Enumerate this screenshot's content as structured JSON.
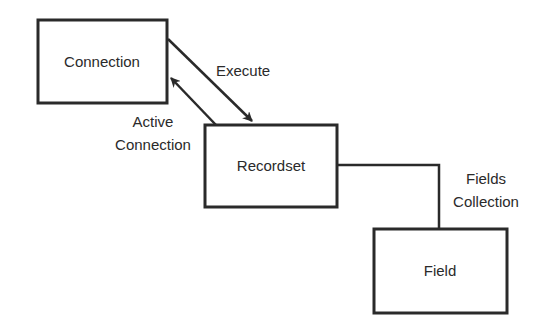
{
  "diagram": {
    "nodes": [
      {
        "id": "connection",
        "label": "Connection",
        "x": 38,
        "y": 20,
        "w": 129,
        "h": 83
      },
      {
        "id": "recordset",
        "label": "Recordset",
        "x": 205,
        "y": 125,
        "w": 132,
        "h": 82
      },
      {
        "id": "field",
        "label": "Field",
        "x": 374,
        "y": 229,
        "w": 133,
        "h": 84
      }
    ],
    "edges": [
      {
        "id": "execute",
        "from": "connection",
        "to": "recordset",
        "label": "Execute",
        "arrow": "end"
      },
      {
        "id": "active-connection",
        "from": "recordset",
        "to": "connection",
        "label_line1": "Active",
        "label_line2": "Connection",
        "arrow": "end"
      },
      {
        "id": "fields-collection",
        "from": "recordset",
        "to": "field",
        "label_line1": "Fields",
        "label_line2": "Collection",
        "arrow": "none"
      }
    ],
    "colors": {
      "stroke": "#2a2a2a",
      "background": "#ffffff"
    }
  }
}
